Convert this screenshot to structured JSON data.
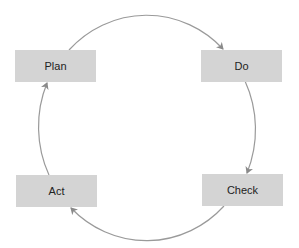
{
  "diagram": {
    "type": "cycle",
    "nodes": [
      {
        "id": "plan",
        "label": "Plan"
      },
      {
        "id": "do",
        "label": "Do"
      },
      {
        "id": "check",
        "label": "Check"
      },
      {
        "id": "act",
        "label": "Act"
      }
    ],
    "edges": [
      {
        "from": "plan",
        "to": "do"
      },
      {
        "from": "do",
        "to": "check"
      },
      {
        "from": "check",
        "to": "act"
      },
      {
        "from": "act",
        "to": "plan"
      }
    ],
    "colors": {
      "box": "#d4d4d4",
      "arrow": "#8a8a8a",
      "text": "#222222"
    }
  }
}
